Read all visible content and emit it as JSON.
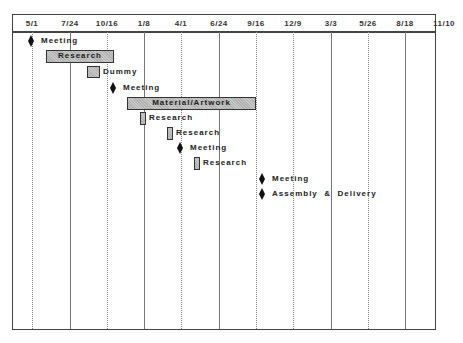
{
  "chart_data": {
    "type": "gantt",
    "title": "",
    "xlabel": "",
    "ylabel": "",
    "axis_position": "top",
    "grid": true,
    "tick_labels": [
      "5/1",
      "7/24",
      "10/16",
      "1/8",
      "4/1",
      "6/24",
      "9/16",
      "12/9",
      "3/3",
      "5/26",
      "8/18",
      "11/10"
    ],
    "tasks": [
      {
        "name": "Meeting",
        "type": "milestone",
        "date": "5/1"
      },
      {
        "name": "Research",
        "type": "task",
        "start": "~6/1",
        "end": "~10/16",
        "label_position": "inside"
      },
      {
        "name": "Dummy",
        "type": "task",
        "start": "~9/15",
        "end": "~10/15",
        "label_position": "right"
      },
      {
        "name": "Meeting",
        "type": "milestone",
        "date": "~10/30"
      },
      {
        "name": "Material/Artwork",
        "type": "task",
        "start": "~12/1",
        "end": "~9/16",
        "label_position": "inside"
      },
      {
        "name": "Research",
        "type": "task",
        "start": "~1/5",
        "end": "~1/20",
        "label_position": "right"
      },
      {
        "name": "Research",
        "type": "task",
        "start": "~3/5",
        "end": "~3/20",
        "label_position": "right"
      },
      {
        "name": "Meeting",
        "type": "milestone",
        "date": "~4/1"
      },
      {
        "name": "Research",
        "type": "task",
        "start": "~5/5",
        "end": "~5/20",
        "label_position": "right"
      },
      {
        "name": "Meeting",
        "type": "milestone",
        "date": "~9/30"
      },
      {
        "name": "Assembly  &  Delivery",
        "type": "milestone",
        "date": "~9/30"
      }
    ]
  },
  "axis": {
    "ticks": [
      {
        "label": "5/1",
        "x": 32,
        "line": "dotted"
      },
      {
        "label": "7/24",
        "x": 70,
        "line": "solid"
      },
      {
        "label": "10/16",
        "x": 107,
        "line": "dotted"
      },
      {
        "label": "1/8",
        "x": 144,
        "line": "solid"
      },
      {
        "label": "4/1",
        "x": 181,
        "line": "dotted"
      },
      {
        "label": "6/24",
        "x": 219,
        "line": "solid"
      },
      {
        "label": "9/16",
        "x": 256,
        "line": "dotted"
      },
      {
        "label": "12/9",
        "x": 293,
        "line": "dotted"
      },
      {
        "label": "3/3",
        "x": 331,
        "line": "solid"
      },
      {
        "label": "5/26",
        "x": 368,
        "line": "dotted"
      },
      {
        "label": "8/18",
        "x": 405,
        "line": "solid"
      },
      {
        "label": "11/10",
        "x": 444,
        "line": "none"
      }
    ]
  },
  "rows": [
    {
      "kind": "milestone",
      "x": 31,
      "y": 35,
      "label": "Meeting"
    },
    {
      "kind": "bar",
      "x": 46,
      "y": 50,
      "w": 68,
      "h": 13,
      "label": "Research",
      "inside": true
    },
    {
      "kind": "bar",
      "x": 87,
      "y": 66,
      "w": 13,
      "h": 12,
      "label": "Dummy",
      "inside": false
    },
    {
      "kind": "milestone",
      "x": 113,
      "y": 82,
      "label": "Meeting"
    },
    {
      "kind": "bar",
      "x": 127,
      "y": 97,
      "w": 129,
      "h": 13,
      "label": "Material/Artwork",
      "inside": true
    },
    {
      "kind": "bar",
      "x": 140,
      "y": 112,
      "w": 6,
      "h": 13,
      "label": "Research",
      "inside": false
    },
    {
      "kind": "bar",
      "x": 167,
      "y": 127,
      "w": 6,
      "h": 13,
      "label": "Research",
      "inside": false
    },
    {
      "kind": "milestone",
      "x": 180,
      "y": 142,
      "label": "Meeting"
    },
    {
      "kind": "bar",
      "x": 194,
      "y": 157,
      "w": 6,
      "h": 13,
      "label": "Research",
      "inside": false
    },
    {
      "kind": "milestone",
      "x": 262,
      "y": 173,
      "label": "Meeting"
    },
    {
      "kind": "milestone",
      "x": 262,
      "y": 188,
      "label": "Assembly  &  Delivery"
    }
  ]
}
